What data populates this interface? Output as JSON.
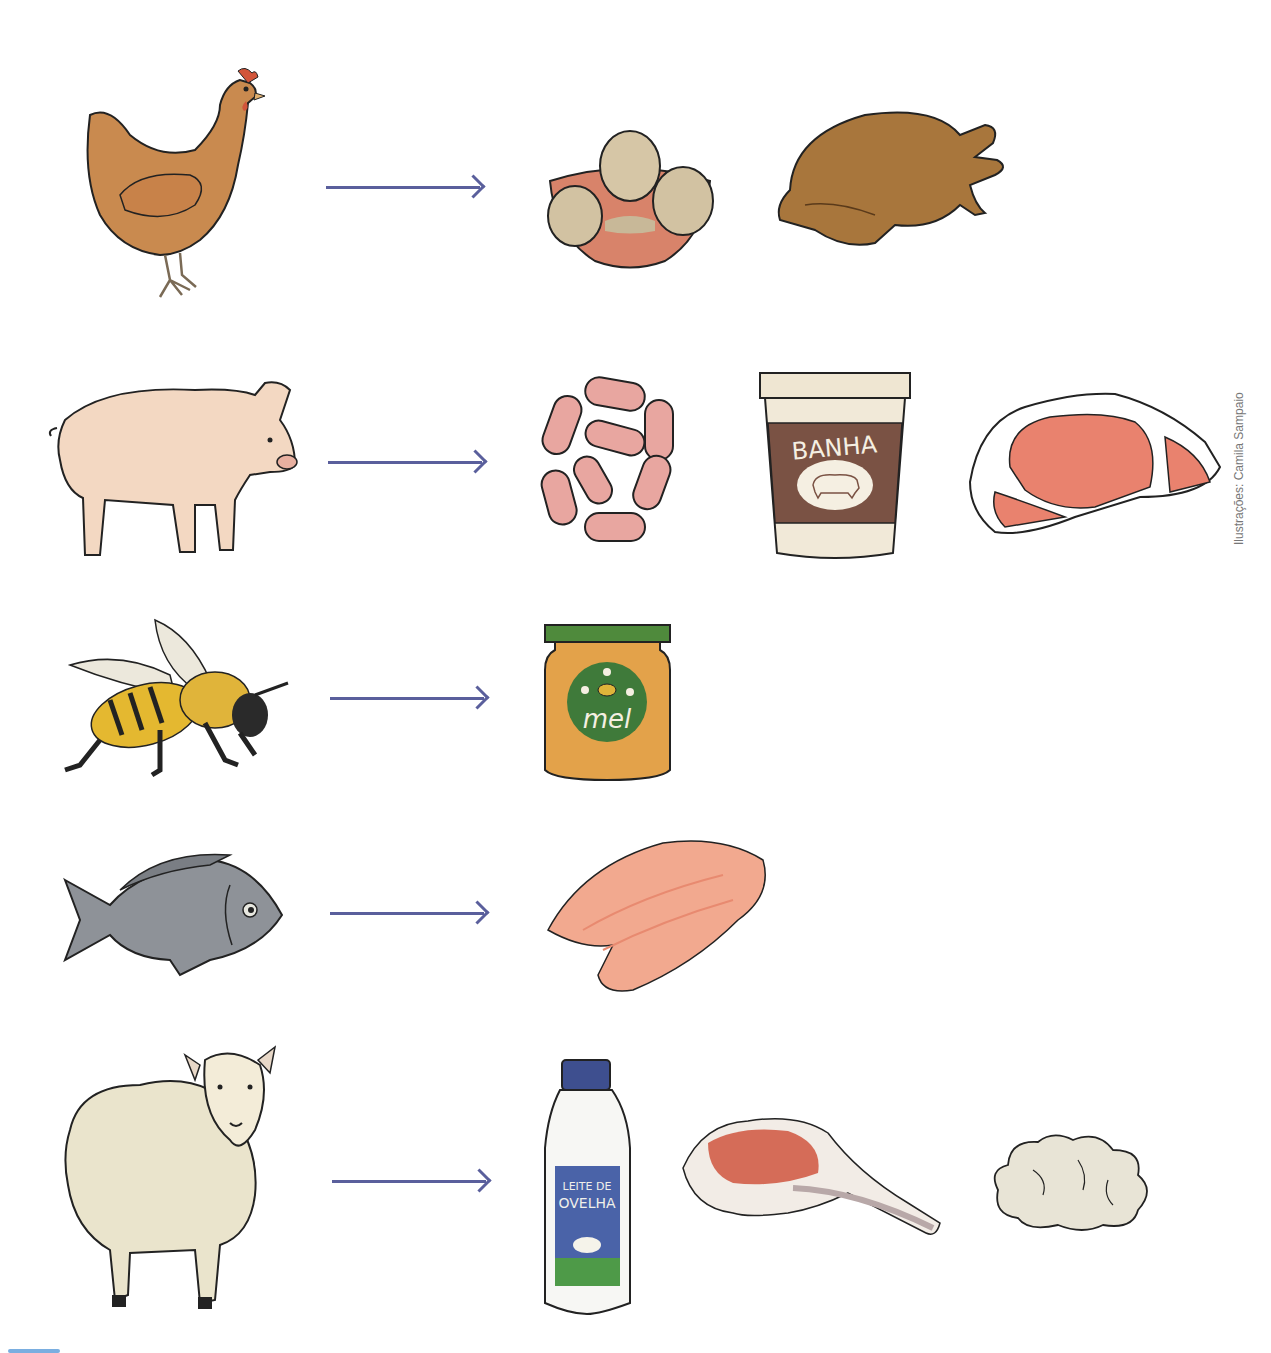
{
  "page": {
    "clipped_title_text": "",
    "credit": "Ilustrações: Camila Sampaio",
    "arrow_color": "#5a5f9c"
  },
  "rows": [
    {
      "animal": {
        "name": "galinha",
        "icon": "hen-icon"
      },
      "products": [
        {
          "name": "ovos",
          "icon": "eggs-bowl-icon"
        },
        {
          "name": "frango",
          "icon": "roast-chicken-icon"
        }
      ]
    },
    {
      "animal": {
        "name": "porco",
        "icon": "pig-icon"
      },
      "products": [
        {
          "name": "linguiça",
          "icon": "sausages-icon"
        },
        {
          "name": "banha",
          "icon": "lard-tub-icon",
          "label": "BANHA"
        },
        {
          "name": "carne de porco",
          "icon": "pork-steak-icon"
        }
      ]
    },
    {
      "animal": {
        "name": "abelha",
        "icon": "bee-icon"
      },
      "products": [
        {
          "name": "mel",
          "icon": "honey-jar-icon",
          "label": "mel"
        }
      ]
    },
    {
      "animal": {
        "name": "peixe",
        "icon": "fish-icon"
      },
      "products": [
        {
          "name": "filé de peixe",
          "icon": "fish-fillet-icon"
        }
      ]
    },
    {
      "animal": {
        "name": "ovelha",
        "icon": "sheep-icon"
      },
      "products": [
        {
          "name": "leite de ovelha",
          "icon": "sheep-milk-bottle-icon",
          "label_line1": "LEITE DE",
          "label_line2": "OVELHA"
        },
        {
          "name": "costela de cordeiro",
          "icon": "lamb-chop-icon"
        },
        {
          "name": "lã",
          "icon": "wool-icon"
        }
      ]
    }
  ]
}
